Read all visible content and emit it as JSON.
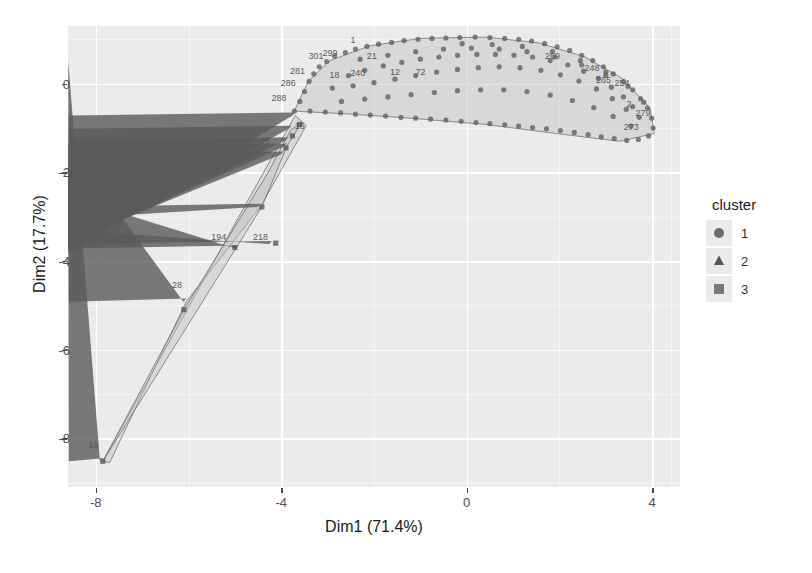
{
  "chart_data": {
    "type": "scatter",
    "title": "",
    "xlabel": "Dim1 (71.4%)",
    "ylabel": "Dim2 (17.7%)",
    "xlim": [
      -8.6,
      4.6
    ],
    "ylim": [
      -9.1,
      1.3
    ],
    "xticks": [
      -8,
      -4,
      0,
      4
    ],
    "xtick_labels": [
      "-8",
      "-4",
      "0",
      "4"
    ],
    "yticks": [
      0,
      -2,
      -4,
      -6,
      -8
    ],
    "ytick_labels": [
      "0",
      "-2",
      "-4",
      "-6",
      "-8"
    ],
    "grid": true,
    "panel_background": "#ebebeb",
    "gridline_color": "#ffffff",
    "point_color": "#5a5a5a",
    "hull_fill": "#bfbfbf",
    "hull_stroke": "#6e6e6e",
    "legend": {
      "title": "cluster",
      "position": "right",
      "entries": [
        {
          "label": "1",
          "shape": "circle",
          "color": "#6b6b6b"
        },
        {
          "label": "2",
          "shape": "triangle",
          "color": "#555555"
        },
        {
          "label": "3",
          "shape": "square",
          "color": "#7a7a7a"
        }
      ]
    },
    "series": [
      {
        "name": "1",
        "shape": "circle",
        "hull": [
          [
            -3.72,
            -0.62
          ],
          [
            -3.42,
            0.05
          ],
          [
            -2.95,
            0.52
          ],
          [
            -2.1,
            0.85
          ],
          [
            -1.0,
            1.02
          ],
          [
            0.4,
            1.05
          ],
          [
            1.55,
            0.92
          ],
          [
            2.55,
            0.6
          ],
          [
            3.35,
            0.12
          ],
          [
            3.95,
            -0.55
          ],
          [
            4.05,
            -1.12
          ],
          [
            3.3,
            -1.3
          ],
          [
            1.9,
            -1.12
          ],
          [
            0.4,
            -0.92
          ],
          [
            -1.2,
            -0.78
          ],
          [
            -2.6,
            -0.68
          ]
        ],
        "points": [
          [
            -3.72,
            -0.62
          ],
          [
            -3.6,
            -0.4
          ],
          [
            -3.5,
            -0.18
          ],
          [
            -3.4,
            0.05
          ],
          [
            -3.3,
            0.22
          ],
          [
            -3.18,
            0.38
          ],
          [
            -3.02,
            0.5
          ],
          [
            -2.85,
            0.62
          ],
          [
            -2.62,
            0.7
          ],
          [
            -2.4,
            0.78
          ],
          [
            -2.15,
            0.84
          ],
          [
            -1.9,
            0.89
          ],
          [
            -1.62,
            0.93
          ],
          [
            -1.35,
            0.97
          ],
          [
            -1.05,
            1.0
          ],
          [
            -0.75,
            1.02
          ],
          [
            -0.45,
            1.03
          ],
          [
            -0.15,
            1.04
          ],
          [
            0.18,
            1.05
          ],
          [
            0.5,
            1.04
          ],
          [
            0.82,
            1.02
          ],
          [
            1.12,
            1.0
          ],
          [
            1.4,
            0.96
          ],
          [
            1.68,
            0.9
          ],
          [
            1.95,
            0.83
          ],
          [
            2.22,
            0.75
          ],
          [
            2.48,
            0.64
          ],
          [
            2.72,
            0.52
          ],
          [
            2.95,
            0.38
          ],
          [
            3.16,
            0.22
          ],
          [
            3.38,
            0.05
          ],
          [
            3.58,
            -0.14
          ],
          [
            3.75,
            -0.34
          ],
          [
            3.9,
            -0.55
          ],
          [
            3.99,
            -0.78
          ],
          [
            4.02,
            -1.0
          ],
          [
            3.92,
            -1.18
          ],
          [
            3.7,
            -1.26
          ],
          [
            3.45,
            -1.28
          ],
          [
            3.18,
            -1.24
          ],
          [
            2.9,
            -1.2
          ],
          [
            2.62,
            -1.15
          ],
          [
            2.32,
            -1.1
          ],
          [
            2.02,
            -1.06
          ],
          [
            1.72,
            -1.02
          ],
          [
            1.42,
            -0.99
          ],
          [
            1.12,
            -0.96
          ],
          [
            0.82,
            -0.93
          ],
          [
            0.5,
            -0.9
          ],
          [
            0.2,
            -0.88
          ],
          [
            -0.12,
            -0.85
          ],
          [
            -0.45,
            -0.82
          ],
          [
            -0.78,
            -0.8
          ],
          [
            -1.1,
            -0.78
          ],
          [
            -1.42,
            -0.76
          ],
          [
            -1.75,
            -0.73
          ],
          [
            -2.08,
            -0.71
          ],
          [
            -2.4,
            -0.69
          ],
          [
            -2.72,
            -0.66
          ],
          [
            -3.05,
            -0.64
          ],
          [
            -3.38,
            -0.62
          ],
          [
            -2.55,
            0.18
          ],
          [
            -2.2,
            0.3
          ],
          [
            -1.8,
            0.4
          ],
          [
            -1.4,
            0.48
          ],
          [
            -1.0,
            0.55
          ],
          [
            -0.6,
            0.6
          ],
          [
            -0.2,
            0.64
          ],
          [
            0.22,
            0.66
          ],
          [
            0.62,
            0.66
          ],
          [
            1.02,
            0.64
          ],
          [
            1.42,
            0.6
          ],
          [
            1.8,
            0.52
          ],
          [
            2.18,
            0.42
          ],
          [
            2.52,
            0.28
          ],
          [
            2.84,
            0.12
          ],
          [
            3.12,
            -0.08
          ],
          [
            3.38,
            -0.3
          ],
          [
            3.58,
            -0.52
          ],
          [
            3.72,
            -0.76
          ],
          [
            -2.9,
            -0.1
          ],
          [
            -2.45,
            -0.05
          ],
          [
            -2.0,
            0.02
          ],
          [
            -1.55,
            0.1
          ],
          [
            -1.1,
            0.18
          ],
          [
            -0.65,
            0.26
          ],
          [
            -0.2,
            0.32
          ],
          [
            0.25,
            0.36
          ],
          [
            0.7,
            0.38
          ],
          [
            1.15,
            0.36
          ],
          [
            1.6,
            0.3
          ],
          [
            2.02,
            0.2
          ],
          [
            2.42,
            0.06
          ],
          [
            2.8,
            -0.12
          ],
          [
            3.14,
            -0.34
          ],
          [
            3.44,
            -0.58
          ],
          [
            -2.7,
            -0.4
          ],
          [
            -2.2,
            -0.35
          ],
          [
            -1.7,
            -0.3
          ],
          [
            -1.2,
            -0.25
          ],
          [
            -0.7,
            -0.2
          ],
          [
            -0.2,
            -0.16
          ],
          [
            0.3,
            -0.14
          ],
          [
            0.8,
            -0.14
          ],
          [
            1.3,
            -0.18
          ],
          [
            1.8,
            -0.26
          ],
          [
            2.28,
            -0.38
          ],
          [
            2.74,
            -0.54
          ],
          [
            3.16,
            -0.74
          ],
          [
            3.54,
            -0.96
          ],
          [
            -0.1,
            0.9
          ],
          [
            0.55,
            0.88
          ],
          [
            1.2,
            0.84
          ],
          [
            1.85,
            0.72
          ],
          [
            2.45,
            0.52
          ],
          [
            3.0,
            0.26
          ],
          [
            3.48,
            -0.06
          ],
          [
            3.82,
            -0.42
          ],
          [
            -2.3,
            0.55
          ],
          [
            -1.7,
            0.64
          ],
          [
            -1.1,
            0.72
          ],
          [
            -0.5,
            0.78
          ],
          [
            0.1,
            0.8
          ],
          [
            0.7,
            0.78
          ],
          [
            1.3,
            0.72
          ],
          [
            1.9,
            0.6
          ],
          [
            2.48,
            0.42
          ],
          [
            3.0,
            0.18
          ]
        ],
        "labels": [
          {
            "text": "288",
            "x": -4.05,
            "y": -0.38
          },
          {
            "text": "286",
            "x": -3.85,
            "y": -0.05
          },
          {
            "text": "281",
            "x": -3.65,
            "y": 0.22
          },
          {
            "text": "301",
            "x": -3.25,
            "y": 0.55
          },
          {
            "text": "299",
            "x": -2.95,
            "y": 0.62
          },
          {
            "text": "1",
            "x": -2.45,
            "y": 0.92
          },
          {
            "text": "21",
            "x": -2.05,
            "y": 0.55
          },
          {
            "text": "240",
            "x": -2.35,
            "y": 0.18
          },
          {
            "text": "18",
            "x": -2.85,
            "y": 0.12
          },
          {
            "text": "12",
            "x": -1.55,
            "y": 0.2
          },
          {
            "text": "72",
            "x": -1.0,
            "y": 0.2
          },
          {
            "text": "269",
            "x": 1.85,
            "y": 0.55
          },
          {
            "text": "248",
            "x": 2.7,
            "y": 0.28
          },
          {
            "text": "265",
            "x": 2.95,
            "y": 0.02
          },
          {
            "text": "254",
            "x": 3.35,
            "y": -0.05
          },
          {
            "text": "2",
            "x": 3.5,
            "y": -0.52
          },
          {
            "text": "279",
            "x": 3.8,
            "y": -0.72
          },
          {
            "text": "273",
            "x": 3.55,
            "y": -1.05
          }
        ]
      },
      {
        "name": "2",
        "shape": "triangle",
        "hull": [
          [
            -7.85,
            -8.52
          ],
          [
            -3.7,
            -0.72
          ],
          [
            -3.46,
            -0.95
          ],
          [
            -4.45,
            -2.78
          ],
          [
            -6.05,
            -4.92
          ],
          [
            -7.7,
            -8.55
          ]
        ],
        "points": [
          [
            -7.85,
            -8.52
          ],
          [
            -6.05,
            -4.92
          ],
          [
            -4.92,
            -3.72
          ],
          [
            -4.45,
            -2.78
          ],
          [
            -4.2,
            -3.62
          ],
          [
            -3.95,
            -1.6
          ],
          [
            -3.85,
            -1.28
          ],
          [
            -3.7,
            -0.72
          ],
          [
            -3.78,
            -1.02
          ],
          [
            -3.88,
            -1.42
          ]
        ],
        "labels": [
          {
            "text": "18",
            "x": -8.05,
            "y": -8.22
          },
          {
            "text": "28",
            "x": -6.25,
            "y": -4.6
          },
          {
            "text": "194",
            "x": -5.35,
            "y": -3.52
          },
          {
            "text": "218",
            "x": -4.45,
            "y": -3.52
          },
          {
            "text": "15",
            "x": -4.35,
            "y": -1.35
          },
          {
            "text": "16",
            "x": -3.6,
            "y": -1.02
          }
        ]
      },
      {
        "name": "3",
        "shape": "square",
        "hull": [
          [
            -7.85,
            -8.52
          ],
          [
            -4.42,
            -2.78
          ],
          [
            -3.88,
            -1.42
          ],
          [
            -3.56,
            -0.88
          ],
          [
            -3.8,
            -1.05
          ],
          [
            -4.28,
            -2.0
          ],
          [
            -6.1,
            -5.1
          ]
        ],
        "points": [
          [
            -7.85,
            -8.52
          ],
          [
            -6.1,
            -5.1
          ],
          [
            -4.42,
            -2.78
          ],
          [
            -4.12,
            -3.6
          ],
          [
            -3.9,
            -1.45
          ],
          [
            -3.76,
            -1.18
          ],
          [
            -3.6,
            -0.92
          ],
          [
            -5.0,
            -3.7
          ]
        ],
        "labels": []
      }
    ]
  }
}
